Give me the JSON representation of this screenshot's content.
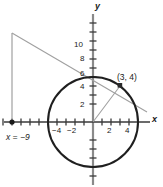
{
  "figure": {
    "title": "",
    "axes": {
      "x_label": "x",
      "y_label": "y",
      "origin_px": [
        93,
        122
      ],
      "unit_px": 9.0,
      "x_tick_labels": [
        "-4",
        "-2",
        "2",
        "4"
      ],
      "x_tick_values": [
        -4,
        -2,
        2,
        4
      ],
      "y_tick_labels": [
        "2",
        "4",
        "6",
        "8",
        "10"
      ],
      "y_tick_values": [
        2,
        4,
        6,
        8,
        10
      ],
      "x_minor_ticks": [
        -10,
        -9,
        -8,
        -7,
        -6,
        -5,
        -4,
        -3,
        -2,
        -1,
        1,
        2,
        3,
        4,
        5,
        6
      ],
      "y_minor_ticks": [
        -5,
        -4,
        -3,
        -2,
        -1,
        1,
        2,
        3,
        4,
        5,
        6,
        7,
        8,
        9,
        10,
        11,
        12
      ],
      "xlim": [
        -11,
        7.5
      ],
      "ylim": [
        -7,
        13.5
      ]
    },
    "circle": {
      "center": [
        0,
        0
      ],
      "radius": 5,
      "color": "#1a1a1a",
      "stroke_px": 2
    },
    "tangent_line": {
      "through_point": [
        3,
        4
      ],
      "from": [
        -9,
        12
      ],
      "to": [
        6,
        1
      ],
      "color": "#9a9a9a"
    },
    "radius_line": {
      "from": [
        0,
        0
      ],
      "to": [
        3,
        4
      ],
      "color": "#9a9a9a"
    },
    "vertical_line": {
      "x": -9,
      "from_y": 0,
      "to_y": 12,
      "color": "#9a9a9a",
      "label": "x = −9"
    },
    "points": [
      {
        "name": "tangency-point",
        "coords": [
          3,
          4
        ],
        "label": "(3, 4)",
        "marker": "square"
      },
      {
        "name": "x-intercept-point",
        "coords": [
          -9,
          0
        ],
        "label": "",
        "marker": "dot"
      }
    ],
    "labels": {
      "point_3_4": "(3, 4)",
      "x_eq_neg9": "x = −9",
      "tick_neg4": "−4",
      "tick_neg2": "−2",
      "tick_2": "2",
      "tick_4": "4",
      "tick_y2": "2",
      "tick_y4": "4",
      "tick_y6": "6",
      "tick_y8": "8",
      "tick_y10": "10",
      "axis_x": "x",
      "axis_y": "y"
    },
    "colors": {
      "ink": "#1a1a1a",
      "axis": "#6f6f6f",
      "construction": "#9a9a9a",
      "background": "#ffffff"
    }
  }
}
